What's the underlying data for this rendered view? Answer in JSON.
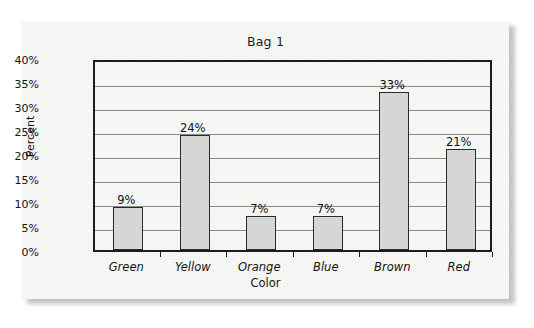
{
  "chart_data": {
    "type": "bar",
    "title": "Bag 1",
    "xlabel": "Color",
    "ylabel": "Percent",
    "categories": [
      "Green",
      "Yellow",
      "Orange",
      "Blue",
      "Brown",
      "Red"
    ],
    "values": [
      9,
      24,
      7,
      7,
      33,
      21
    ],
    "value_labels": [
      "9%",
      "24%",
      "7%",
      "7%",
      "33%",
      "21%"
    ],
    "ylim": [
      0,
      40
    ],
    "ytick_labels": [
      "40%",
      "35%",
      "30%",
      "25%",
      "20%",
      "15%",
      "10%",
      "5%",
      "0%"
    ],
    "ytick_values": [
      40,
      35,
      30,
      25,
      20,
      15,
      10,
      5,
      0
    ],
    "grid": true,
    "legend": "none",
    "bar_fill_color": "#d6d6d6",
    "bar_border_color": "#2a2a2a",
    "axis_color": "#1c1c1c",
    "gridline_color": "#8a8a8a",
    "page_background_color": "#f7f7f6"
  }
}
